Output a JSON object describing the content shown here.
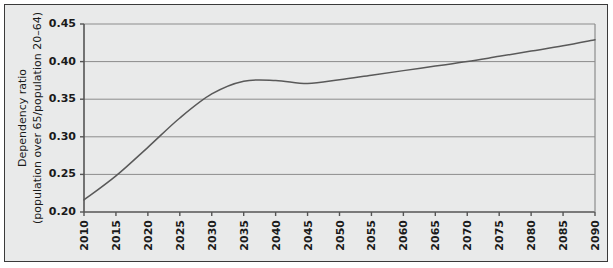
{
  "figure": {
    "background_color": "#e9eaea",
    "frame_color": "#3a3a3a",
    "plot_background_color": "#e9eaea",
    "line_color": "#595959",
    "gridline_color": "#8c8c8c",
    "axis_color": "#555555"
  },
  "chart_data": {
    "type": "line",
    "title": "",
    "xlabel": "",
    "ylabel_line1": "Dependency ratio",
    "ylabel_line2": "(population over 65/population 20–64)",
    "xlim": [
      2010,
      2090
    ],
    "ylim": [
      0.2,
      0.45
    ],
    "yticks": [
      0.2,
      0.25,
      0.3,
      0.35,
      0.4,
      0.45
    ],
    "ytick_labels": [
      "0.20",
      "0.25",
      "0.30",
      "0.35",
      "0.40",
      "0.45"
    ],
    "xticks": [
      2010,
      2015,
      2020,
      2025,
      2030,
      2035,
      2040,
      2045,
      2050,
      2055,
      2060,
      2065,
      2070,
      2075,
      2080,
      2085,
      2090
    ],
    "xtick_labels": [
      "2010",
      "2015",
      "2020",
      "2025",
      "2030",
      "2035",
      "2040",
      "2045",
      "2050",
      "2055",
      "2060",
      "2065",
      "2070",
      "2075",
      "2080",
      "2085",
      "2090"
    ],
    "grid": true,
    "grid_axis": "y",
    "legend": false,
    "x": [
      2010,
      2015,
      2020,
      2025,
      2030,
      2035,
      2040,
      2045,
      2050,
      2055,
      2060,
      2065,
      2070,
      2075,
      2080,
      2085,
      2090
    ],
    "values": [
      0.216,
      0.248,
      0.286,
      0.325,
      0.357,
      0.374,
      0.375,
      0.371,
      0.376,
      0.382,
      0.388,
      0.394,
      0.4,
      0.407,
      0.414,
      0.421,
      0.429
    ],
    "series": [
      {
        "name": "Dependency ratio",
        "values": [
          0.216,
          0.248,
          0.286,
          0.325,
          0.357,
          0.374,
          0.375,
          0.371,
          0.376,
          0.382,
          0.388,
          0.394,
          0.4,
          0.407,
          0.414,
          0.421,
          0.429
        ]
      }
    ]
  }
}
